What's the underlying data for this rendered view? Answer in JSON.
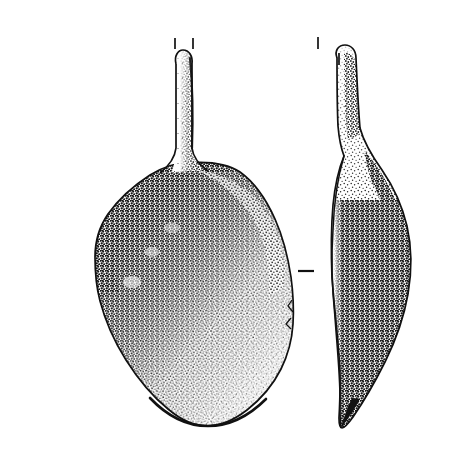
{
  "figure": {
    "kind": "archaeological-object-illustration",
    "technique": "pen-and-ink stipple shading",
    "background_color": "#ffffff",
    "ink_color": "#111111",
    "width_px": 456,
    "height_px": 470,
    "caption": "",
    "title": "",
    "scale_bar_text": ""
  },
  "views": [
    {
      "id": "plan-view",
      "name": "plan-view-spoon-front",
      "label": "",
      "description": "Front/plan view of a long-handled spoon-like object: slender straight handle rising from a broad pear-shaped bowl.",
      "handle": {
        "top_y": 50,
        "bottom_y": 172,
        "left_x": 173,
        "right_x": 193,
        "shading": "stipple along right edge, graded light-to-dark downward"
      },
      "bowl": {
        "top_y": 160,
        "bottom_y": 426,
        "left_x": 95,
        "right_x": 295,
        "shape": "pear / teardrop, widest below centre",
        "shading": "dense stipple upper-left graded to blank lower-right"
      },
      "tick_marks": [
        {
          "name": "handle-tip-tick-left",
          "orientation": "vertical",
          "x": 175,
          "y1": 38,
          "y2": 49
        },
        {
          "name": "handle-tip-tick-right",
          "orientation": "vertical",
          "x": 193,
          "y1": 38,
          "y2": 49
        },
        {
          "name": "bowl-width-tick-right",
          "orientation": "horizontal",
          "x1": 298,
          "x2": 314,
          "y": 271
        }
      ]
    },
    {
      "id": "profile-view",
      "name": "profile-view-spoon-side",
      "label": "",
      "description": "Side/profile view: narrow curved sickle-shaped section, thin at the top of the handle, swelling through the bowl, tapering to a point at the base.",
      "outline": {
        "top_y": 44,
        "bottom_y": 428,
        "left_x": 328,
        "right_x": 412,
        "shading": "solid dense stipple, thin reserved highlight along left edge"
      },
      "tick_marks": [
        {
          "name": "profile-tip-tick-upper-left",
          "orientation": "vertical",
          "x": 318,
          "y1": 37,
          "y2": 49
        },
        {
          "name": "profile-tip-tick-right",
          "orientation": "vertical",
          "x": 339,
          "y1": 53,
          "y2": 65
        }
      ]
    }
  ],
  "annotations": {
    "tick_mark_purpose": "registration / break-and-section indicators",
    "tick_count": 5,
    "tick_color": "#111111"
  }
}
